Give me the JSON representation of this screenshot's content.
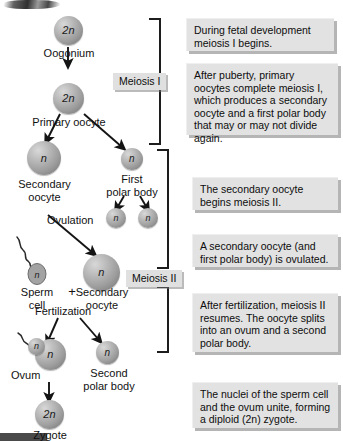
{
  "diagram": {
    "cells": [
      {
        "id": "oogonium",
        "ploidy": "2n",
        "label": "Oogonium"
      },
      {
        "id": "primary-oocyte",
        "ploidy": "2n",
        "label": "Primary oocyte"
      },
      {
        "id": "secondary-oocyte",
        "ploidy": "n",
        "label": "Secondary\noocyte"
      },
      {
        "id": "first-polar-body",
        "ploidy": "n",
        "label": "First\npolar body"
      },
      {
        "id": "polar-body-daughter-left",
        "ploidy": "n",
        "label": ""
      },
      {
        "id": "polar-body-daughter-right",
        "ploidy": "n",
        "label": ""
      },
      {
        "id": "sperm-cell",
        "ploidy": "n",
        "label": "Sperm\ncell"
      },
      {
        "id": "secondary-oocyte-ovulated",
        "ploidy": "n",
        "label": "Secondary\noocyte"
      },
      {
        "id": "ovum",
        "ploidy": "n",
        "label": "Ovum"
      },
      {
        "id": "sperm-nucleus-in-ovum",
        "ploidy": "n",
        "label": ""
      },
      {
        "id": "second-polar-body",
        "ploidy": "n",
        "label": "Second\npolar body"
      },
      {
        "id": "zygote",
        "ploidy": "2n",
        "label": "Zygote"
      }
    ],
    "process_labels": [
      {
        "id": "ovulation",
        "text": "Ovulation"
      },
      {
        "id": "fertilization",
        "text": "Fertilization"
      },
      {
        "id": "plus-sign",
        "text": "+"
      }
    ],
    "stage_labels": [
      {
        "id": "meiosis-1",
        "text": "Meiosis I"
      },
      {
        "id": "meiosis-2",
        "text": "Meiosis II"
      }
    ],
    "callouts": [
      {
        "id": "callout-1",
        "text": "During fetal development meiosis I begins."
      },
      {
        "id": "callout-2",
        "text": "After puberty, primary oocytes complete meiosis I, which produces a secondary oocyte and a first polar body that may or may not divide again."
      },
      {
        "id": "callout-3",
        "text": "The secondary oocyte begins meiosis II."
      },
      {
        "id": "callout-4",
        "text": "A secondary oocyte (and first polar body) is ovulated."
      },
      {
        "id": "callout-5",
        "text": "After fertilization, meiosis II resumes. The oocyte splits into an ovum and a second polar body."
      },
      {
        "id": "callout-6",
        "text": "The nuclei of the sperm cell and the ovum unite, forming a diploid (2n) zygote."
      }
    ],
    "colors": {
      "cell_fill": "#9d9d9d",
      "cell_highlight": "#d8d8d8",
      "callout_bg": "#e2e2e2",
      "stage_bg": "#e0e0e0",
      "stroke": "#1d1d1d",
      "background": "#ffffff"
    }
  }
}
